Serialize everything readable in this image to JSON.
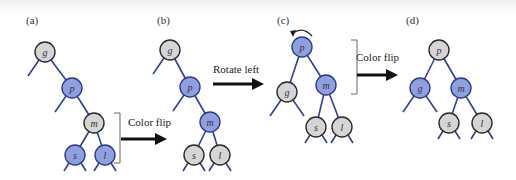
{
  "figure": {
    "colors": {
      "blue_fill": "#8fa0e0",
      "blue_stroke": "#2d3a8c",
      "gray_fill": "#d5d5d5",
      "gray_stroke": "#2a2a2a",
      "edge": "#2f3f9e",
      "arrow": "#111111",
      "bracket": "#666666"
    },
    "panels": [
      {
        "label": "(a)",
        "nodes": [
          {
            "key": "g",
            "color": "gray"
          },
          {
            "key": "p",
            "color": "blue"
          },
          {
            "key": "m",
            "color": "gray"
          },
          {
            "key": "s",
            "color": "blue"
          },
          {
            "key": "l",
            "color": "blue"
          }
        ]
      },
      {
        "label": "(b)",
        "nodes": [
          {
            "key": "g",
            "color": "gray"
          },
          {
            "key": "p",
            "color": "blue"
          },
          {
            "key": "m",
            "color": "blue"
          },
          {
            "key": "s",
            "color": "gray"
          },
          {
            "key": "l",
            "color": "gray"
          }
        ]
      },
      {
        "label": "(c)",
        "nodes": [
          {
            "key": "p",
            "color": "blue"
          },
          {
            "key": "g",
            "color": "gray"
          },
          {
            "key": "m",
            "color": "blue"
          },
          {
            "key": "s",
            "color": "gray"
          },
          {
            "key": "l",
            "color": "gray"
          }
        ]
      },
      {
        "label": "(d)",
        "nodes": [
          {
            "key": "p",
            "color": "gray"
          },
          {
            "key": "g",
            "color": "blue"
          },
          {
            "key": "m",
            "color": "blue"
          },
          {
            "key": "s",
            "color": "gray"
          },
          {
            "key": "l",
            "color": "gray"
          }
        ]
      }
    ],
    "steps": [
      {
        "label": "Color flip",
        "from": "(a)",
        "to": "(b)"
      },
      {
        "label": "Rotate left",
        "from": "(b)",
        "to": "(c)"
      },
      {
        "label": "Color flip",
        "from": "(c)",
        "to": "(d)"
      }
    ]
  }
}
